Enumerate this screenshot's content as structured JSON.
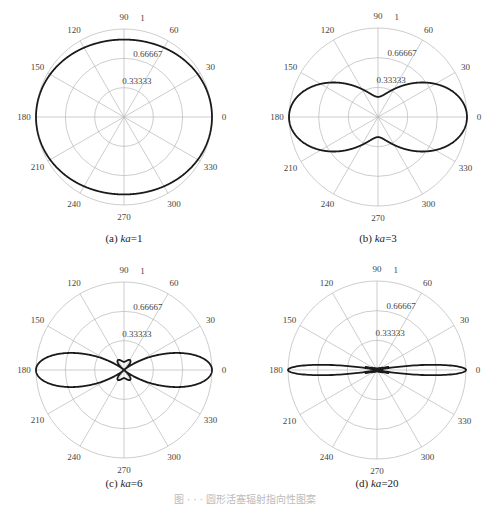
{
  "chart_data": [
    {
      "type": "polar",
      "panel": "a",
      "caption": "(a)  ka=1",
      "caption_prefix": "(a)",
      "param_label": "ka",
      "param_value": 1,
      "theta_ticks_deg": [
        0,
        30,
        60,
        90,
        120,
        150,
        180,
        210,
        240,
        270,
        300,
        330
      ],
      "r_ticks": [
        "0.33333",
        "0.66667",
        "1"
      ],
      "rlim": [
        0,
        1
      ],
      "formula": "|2 J1(ka sinθ) / (ka sinθ)|",
      "sample_values": {
        "0": 1.0,
        "30": 0.97,
        "60": 0.91,
        "90": 0.88
      }
    },
    {
      "type": "polar",
      "panel": "b",
      "caption": "(b)  ka=3",
      "caption_prefix": "(b)",
      "param_label": "ka",
      "param_value": 3,
      "theta_ticks_deg": [
        0,
        30,
        60,
        90,
        120,
        150,
        180,
        210,
        240,
        270,
        300,
        330
      ],
      "r_ticks": [
        "0.33333",
        "0.66667",
        "1"
      ],
      "rlim": [
        0,
        1
      ],
      "formula": "|2 J1(ka sinθ) / (ka sinθ)|",
      "sample_values": {
        "0": 1.0,
        "30": 0.81,
        "60": 0.48,
        "90": 0.23
      }
    },
    {
      "type": "polar",
      "panel": "c",
      "caption": "(c)  ka=6",
      "caption_prefix": "(c)",
      "param_label": "ka",
      "param_value": 6,
      "theta_ticks_deg": [
        0,
        30,
        60,
        90,
        120,
        150,
        180,
        210,
        240,
        270,
        300,
        330
      ],
      "r_ticks": [
        "0.33333",
        "0.66667",
        "1"
      ],
      "rlim": [
        0,
        1
      ],
      "formula": "|2 J1(ka sinθ) / (ka sinθ)|",
      "sample_values": {
        "0": 1.0,
        "30": 0.44,
        "60": 0.04,
        "90": 0.09
      }
    },
    {
      "type": "polar",
      "panel": "d",
      "caption": "(d)  ka=20",
      "caption_prefix": "(d)",
      "param_label": "ka",
      "param_value": 20,
      "theta_ticks_deg": [
        0,
        30,
        60,
        90,
        120,
        150,
        180,
        210,
        240,
        270,
        300,
        330
      ],
      "r_ticks": [
        "0.33333",
        "0.66667",
        "1"
      ],
      "rlim": [
        0,
        1
      ],
      "formula": "|2 J1(ka sinθ) / (ka sinθ)|",
      "sample_values": {
        "0": 1.0,
        "10": 0.45,
        "30": 0.02,
        "90": 0.01
      }
    }
  ],
  "panels": [
    {
      "cx": 124,
      "cy": 117,
      "R": 88,
      "caption_x": 124,
      "caption_y": 242
    },
    {
      "cx": 378,
      "cy": 117,
      "R": 89,
      "caption_x": 378,
      "caption_y": 242
    },
    {
      "cx": 124,
      "cy": 370,
      "R": 88,
      "caption_x": 124,
      "caption_y": 487
    },
    {
      "cx": 377,
      "cy": 370,
      "R": 89,
      "caption_x": 377,
      "caption_y": 487
    }
  ],
  "figure_caption": "图 · · · 圆形活塞辐射指向性图案"
}
